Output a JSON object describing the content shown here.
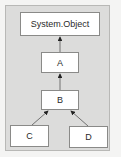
{
  "diagram": {
    "type": "class-hierarchy",
    "nodes": {
      "root": {
        "label": "System.Object"
      },
      "a": {
        "label": "A"
      },
      "b": {
        "label": "B"
      },
      "c": {
        "label": "C"
      },
      "d": {
        "label": "D"
      }
    },
    "edges": [
      {
        "from": "A",
        "to": "System.Object"
      },
      {
        "from": "B",
        "to": "A"
      },
      {
        "from": "C",
        "to": "B"
      },
      {
        "from": "D",
        "to": "B"
      }
    ],
    "colors": {
      "panel": "#dcdcdb",
      "box": "#ffffff",
      "line": "#333333"
    }
  }
}
